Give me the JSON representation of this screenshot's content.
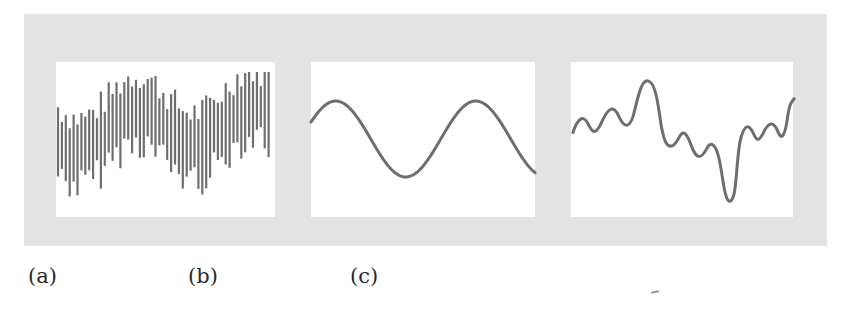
{
  "figure": {
    "frame_color": "#e3e3e3",
    "panel_color": "#ffffff",
    "stroke_color": "#6e6e6e",
    "panels": [
      {
        "id": "a",
        "caption": "(a)",
        "kind": "sampled-bars",
        "description": "Dense vertical bars whose extents follow a noisy oscillating envelope"
      },
      {
        "id": "b",
        "caption": "(b)",
        "kind": "sine",
        "description": "Smooth sinusoid, about 1.6 cycles"
      },
      {
        "id": "c",
        "caption": "(c)",
        "kind": "composite-wave",
        "description": "Irregular wave built from low- and high-frequency components"
      }
    ]
  }
}
